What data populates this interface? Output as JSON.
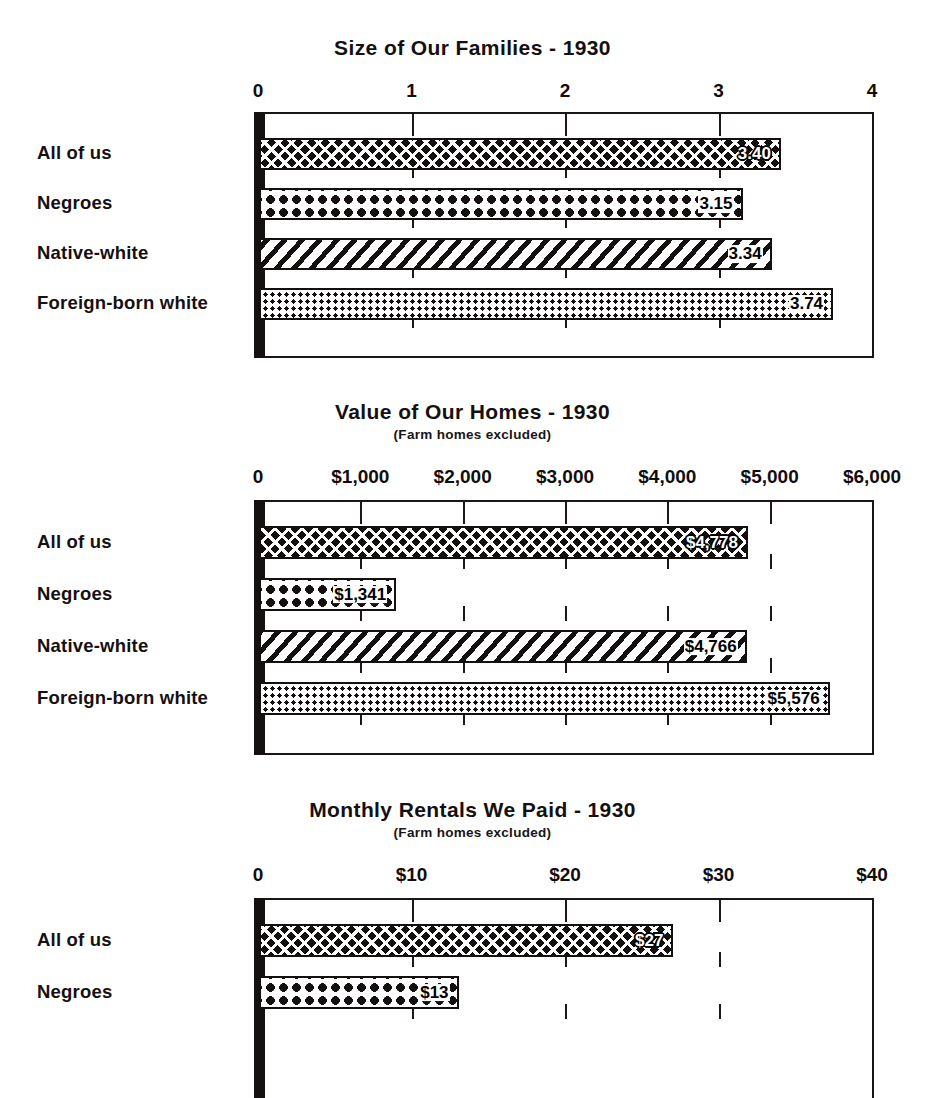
{
  "page": {
    "width": 945,
    "height": 1012,
    "ink_color": "#161111",
    "paper_color": "#ffffff"
  },
  "charts": [
    {
      "id": "size-of-families",
      "title": "Size of Our Families - 1930",
      "subtitle": "",
      "axis_ticks": [
        "0",
        "1",
        "2",
        "3",
        "4"
      ],
      "rows": [
        {
          "label": "All of us",
          "value_label": "3.40",
          "pattern": "crosshatch"
        },
        {
          "label": "Negroes",
          "value_label": "3.15",
          "pattern": "bigdots"
        },
        {
          "label": "Native-white",
          "value_label": "3.34",
          "pattern": "diagonal"
        },
        {
          "label": "Foreign-born white",
          "value_label": "3.74",
          "pattern": "finedots"
        }
      ]
    },
    {
      "id": "value-of-homes",
      "title": "Value of Our Homes - 1930",
      "subtitle": "(Farm homes excluded)",
      "axis_ticks": [
        "0",
        "$1,000",
        "$2,000",
        "$3,000",
        "$4,000",
        "$5,000",
        "$6,000"
      ],
      "rows": [
        {
          "label": "All of us",
          "value_label": "$4,778",
          "pattern": "crosshatch"
        },
        {
          "label": "Negroes",
          "value_label": "$1,341",
          "pattern": "bigdots"
        },
        {
          "label": "Native-white",
          "value_label": "$4,766",
          "pattern": "diagonal"
        },
        {
          "label": "Foreign-born white",
          "value_label": "$5,576",
          "pattern": "finedots"
        }
      ]
    },
    {
      "id": "monthly-rentals",
      "title": "Monthly Rentals We Paid - 1930",
      "subtitle": "(Farm homes excluded)",
      "axis_ticks": [
        "0",
        "$10",
        "$20",
        "$30",
        "$40"
      ],
      "rows": [
        {
          "label": "All of us",
          "value_label": "$27",
          "pattern": "crosshatch"
        },
        {
          "label": "Negroes",
          "value_label": "$13",
          "pattern": "bigdots"
        }
      ]
    }
  ],
  "chart_data": [
    {
      "type": "bar",
      "orientation": "horizontal",
      "title": "Size of Our Families - 1930",
      "subtitle": "",
      "xlabel": "",
      "ylabel": "",
      "categories": [
        "All of us",
        "Negroes",
        "Native-white",
        "Foreign-born white"
      ],
      "values": [
        3.4,
        3.15,
        3.34,
        3.74
      ],
      "data_labels": [
        "3.40",
        "3.15",
        "3.34",
        "3.74"
      ],
      "xlim": [
        0,
        4
      ],
      "xticks": [
        0,
        1,
        2,
        3,
        4
      ],
      "xtick_labels": [
        "0",
        "1",
        "2",
        "3",
        "4"
      ],
      "grid": true,
      "legend": false,
      "bar_patterns": [
        "crosshatch",
        "bigdots",
        "diagonal",
        "finedots"
      ]
    },
    {
      "type": "bar",
      "orientation": "horizontal",
      "title": "Value of Our Homes - 1930",
      "subtitle": "(Farm homes excluded)",
      "xlabel": "",
      "ylabel": "",
      "categories": [
        "All of us",
        "Negroes",
        "Native-white",
        "Foreign-born white"
      ],
      "values": [
        4778,
        1341,
        4766,
        5576
      ],
      "data_labels": [
        "$4,778",
        "$1,341",
        "$4,766",
        "$5,576"
      ],
      "xlim": [
        0,
        6000
      ],
      "xticks": [
        0,
        1000,
        2000,
        3000,
        4000,
        5000,
        6000
      ],
      "xtick_labels": [
        "0",
        "$1,000",
        "$2,000",
        "$3,000",
        "$4,000",
        "$5,000",
        "$6,000"
      ],
      "grid": true,
      "legend": false,
      "bar_patterns": [
        "crosshatch",
        "bigdots",
        "diagonal",
        "finedots"
      ]
    },
    {
      "type": "bar",
      "orientation": "horizontal",
      "title": "Monthly Rentals We Paid - 1930",
      "subtitle": "(Farm homes excluded)",
      "xlabel": "",
      "ylabel": "",
      "categories": [
        "All of us",
        "Negroes"
      ],
      "values": [
        27,
        13
      ],
      "data_labels": [
        "$27",
        "$13"
      ],
      "xlim": [
        0,
        40
      ],
      "xticks": [
        0,
        10,
        20,
        30,
        40
      ],
      "xtick_labels": [
        "0",
        "$10",
        "$20",
        "$30",
        "$40"
      ],
      "grid": true,
      "legend": false,
      "bar_patterns": [
        "crosshatch",
        "bigdots"
      ],
      "note": "chart is cropped at the bottom edge of the image; only the first two rows are visible"
    }
  ]
}
